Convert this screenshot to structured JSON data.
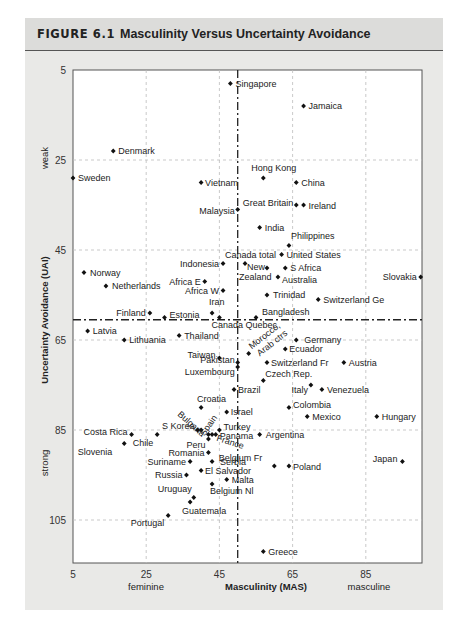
{
  "figure": {
    "label": "FIGURE 6.1",
    "title": "Masculinity Versus Uncertainty Avoidance"
  },
  "chart_data": {
    "type": "scatter",
    "xlabel": "Masculinity (MAS)",
    "ylabel": "Uncertainty Avoidance (UAI)",
    "x_pole_labels": {
      "low": "feminine",
      "high": "masculine"
    },
    "y_pole_labels": {
      "low": "weak",
      "high": "strong"
    },
    "xlim": [
      5,
      100
    ],
    "ylim": [
      5,
      115
    ],
    "y_inverted": true,
    "xticks": [
      5,
      25,
      45,
      65,
      85
    ],
    "yticks": [
      5,
      25,
      45,
      65,
      85,
      105
    ],
    "grid": true,
    "reference_lines": {
      "x": 50,
      "y": 60.5,
      "style": "dash-dot"
    },
    "points": [
      {
        "name": "Singapore",
        "x": 48,
        "y": 8
      },
      {
        "name": "Jamaica",
        "x": 68,
        "y": 13
      },
      {
        "name": "Denmark",
        "x": 16,
        "y": 23
      },
      {
        "name": "Sweden",
        "x": 5,
        "y": 29
      },
      {
        "name": "Vietnam",
        "x": 40,
        "y": 30
      },
      {
        "name": "Hong Kong",
        "x": 57,
        "y": 29
      },
      {
        "name": "China",
        "x": 66,
        "y": 30
      },
      {
        "name": "Malaysia",
        "x": 50,
        "y": 36
      },
      {
        "name": "Great Britain",
        "x": 66,
        "y": 35
      },
      {
        "name": "Ireland",
        "x": 68,
        "y": 35
      },
      {
        "name": "India",
        "x": 56,
        "y": 40
      },
      {
        "name": "Philippines",
        "x": 64,
        "y": 44
      },
      {
        "name": "Canada total",
        "x": 52,
        "y": 48
      },
      {
        "name": "United States",
        "x": 62,
        "y": 46
      },
      {
        "name": "Indonesia",
        "x": 46,
        "y": 48
      },
      {
        "name": "New Zealand",
        "x": 58,
        "y": 49
      },
      {
        "name": "S Africa",
        "x": 63,
        "y": 49
      },
      {
        "name": "Australia",
        "x": 61,
        "y": 51
      },
      {
        "name": "Norway",
        "x": 8,
        "y": 50
      },
      {
        "name": "Netherlands",
        "x": 14,
        "y": 53
      },
      {
        "name": "Africa E",
        "x": 41,
        "y": 52
      },
      {
        "name": "Africa W",
        "x": 46,
        "y": 54
      },
      {
        "name": "Trinidad",
        "x": 58,
        "y": 55
      },
      {
        "name": "Switzerland Ge",
        "x": 72,
        "y": 56
      },
      {
        "name": "Slovakia",
        "x": 100,
        "y": 51
      },
      {
        "name": "Finland",
        "x": 26,
        "y": 59
      },
      {
        "name": "Estonia",
        "x": 30,
        "y": 60
      },
      {
        "name": "Iran",
        "x": 43,
        "y": 59
      },
      {
        "name": "Canada Quebec",
        "x": 45,
        "y": 60
      },
      {
        "name": "Bangladesh",
        "x": 55,
        "y": 60
      },
      {
        "name": "Latvia",
        "x": 9,
        "y": 63
      },
      {
        "name": "Lithuania",
        "x": 19,
        "y": 65
      },
      {
        "name": "Thailand",
        "x": 34,
        "y": 64
      },
      {
        "name": "Morocco, Arab ctrs",
        "x": 53,
        "y": 68
      },
      {
        "name": "Germany",
        "x": 66,
        "y": 65
      },
      {
        "name": "Ecuador",
        "x": 63,
        "y": 67
      },
      {
        "name": "Taiwan",
        "x": 45,
        "y": 69
      },
      {
        "name": "Pakistan",
        "x": 50,
        "y": 70
      },
      {
        "name": "Luxembourg",
        "x": 50,
        "y": 71
      },
      {
        "name": "Switzerland Fr",
        "x": 58,
        "y": 70
      },
      {
        "name": "Austria",
        "x": 79,
        "y": 70
      },
      {
        "name": "Czech Rep.",
        "x": 57,
        "y": 74
      },
      {
        "name": "Brazil",
        "x": 49,
        "y": 76
      },
      {
        "name": "Italy",
        "x": 70,
        "y": 75
      },
      {
        "name": "Venezuela",
        "x": 73,
        "y": 76
      },
      {
        "name": "Croatia",
        "x": 40,
        "y": 80
      },
      {
        "name": "Israel",
        "x": 47,
        "y": 81
      },
      {
        "name": "Colombia",
        "x": 64,
        "y": 80
      },
      {
        "name": "Mexico",
        "x": 69,
        "y": 82
      },
      {
        "name": "Hungary",
        "x": 88,
        "y": 82
      },
      {
        "name": "Bulgaria",
        "x": 40,
        "y": 85
      },
      {
        "name": "S Korea",
        "x": 39,
        "y": 85
      },
      {
        "name": "Spain",
        "x": 42,
        "y": 86
      },
      {
        "name": "Turkey",
        "x": 45,
        "y": 85
      },
      {
        "name": "Peru",
        "x": 42,
        "y": 87
      },
      {
        "name": "Panama",
        "x": 44,
        "y": 86
      },
      {
        "name": "France",
        "x": 43,
        "y": 86
      },
      {
        "name": "Costa Rica",
        "x": 21,
        "y": 86
      },
      {
        "name": "Chile",
        "x": 28,
        "y": 86
      },
      {
        "name": "Slovenia",
        "x": 19,
        "y": 88
      },
      {
        "name": "Argentina",
        "x": 56,
        "y": 86
      },
      {
        "name": "Romania",
        "x": 42,
        "y": 90
      },
      {
        "name": "Suriname",
        "x": 37,
        "y": 92
      },
      {
        "name": "Serbia",
        "x": 43,
        "y": 92
      },
      {
        "name": "Belgium Fr",
        "x": 60,
        "y": 93
      },
      {
        "name": "Poland",
        "x": 64,
        "y": 93
      },
      {
        "name": "Japan",
        "x": 95,
        "y": 92
      },
      {
        "name": "Russia",
        "x": 36,
        "y": 95
      },
      {
        "name": "El Salvador",
        "x": 40,
        "y": 94
      },
      {
        "name": "Malta",
        "x": 47,
        "y": 96
      },
      {
        "name": "Belgium Nl",
        "x": 43,
        "y": 97
      },
      {
        "name": "Uruguay",
        "x": 38,
        "y": 100
      },
      {
        "name": "Guatemala",
        "x": 37,
        "y": 101
      },
      {
        "name": "Portugal",
        "x": 31,
        "y": 104
      },
      {
        "name": "Greece",
        "x": 57,
        "y": 112
      }
    ]
  }
}
